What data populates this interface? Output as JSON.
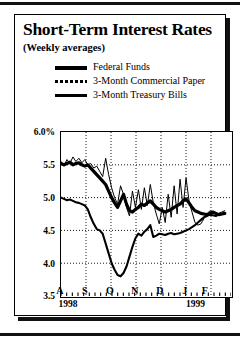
{
  "figure": {
    "title": "Short-Term Interest Rates",
    "subtitle": "(Weekly averages)"
  },
  "chart_data": {
    "type": "line",
    "title": "Short-Term Interest Rates",
    "subtitle": "(Weekly averages)",
    "xlabel": "",
    "ylabel": "",
    "ylim": [
      3.5,
      6.0
    ],
    "yticks": [
      "6.0%",
      "5.5",
      "5.0",
      "4.5",
      "4.0",
      "3.5"
    ],
    "ytick_values": [
      6.0,
      5.5,
      5.0,
      4.5,
      4.0,
      3.5
    ],
    "xticks": [
      "A",
      "S",
      "O",
      "N",
      "D",
      "J",
      "F"
    ],
    "xtick_positions": [
      0.5,
      1.5,
      2.5,
      3.5,
      4.5,
      5.5,
      6.3
    ],
    "year_labels": [
      {
        "text": "1998",
        "x": 0.45
      },
      {
        "text": "1999",
        "x": 5.55
      }
    ],
    "grid": "dotted-both",
    "legend_position": "above-plot",
    "xlim": [
      0,
      6.8
    ],
    "series": [
      {
        "name": "Federal Funds",
        "style": "thick-solid",
        "values": [
          5.52,
          5.5,
          5.52,
          5.54,
          5.5,
          5.52,
          5.53,
          5.5,
          5.48,
          5.5,
          5.45,
          5.4,
          5.35,
          5.3,
          5.25,
          5.2,
          5.1,
          5.0,
          4.92,
          4.85,
          4.95,
          5.05,
          4.9,
          4.8,
          4.78,
          4.82,
          4.85,
          4.9,
          4.88,
          4.92,
          4.95,
          4.9,
          4.85,
          4.82,
          4.8,
          4.78,
          4.8,
          4.82,
          4.85,
          4.88,
          4.9,
          4.95,
          4.98,
          4.92,
          4.85,
          4.8,
          4.78,
          4.76,
          4.75,
          4.74,
          4.76,
          4.78,
          4.76,
          4.74,
          4.75,
          4.76
        ]
      },
      {
        "name": "3-Month Commercial Paper",
        "style": "thin-solid",
        "values": [
          5.55,
          5.48,
          5.58,
          5.52,
          5.62,
          5.55,
          5.6,
          5.53,
          5.58,
          5.5,
          5.52,
          5.45,
          5.48,
          5.4,
          5.32,
          5.6,
          5.35,
          5.15,
          5.0,
          4.9,
          5.18,
          5.05,
          4.85,
          4.72,
          5.1,
          4.85,
          5.12,
          4.82,
          5.15,
          4.88,
          5.2,
          4.92,
          4.75,
          4.6,
          4.85,
          4.62,
          5.05,
          4.7,
          5.18,
          4.75,
          5.28,
          4.85,
          5.3,
          4.95,
          4.78,
          4.62,
          4.58,
          4.6,
          4.68,
          4.75,
          4.8,
          4.78,
          4.74,
          4.76,
          4.78,
          4.8
        ]
      },
      {
        "name": "3-Month Treasury Bills",
        "style": "medium-solid",
        "values": [
          5.0,
          4.98,
          4.96,
          4.97,
          4.95,
          4.93,
          4.92,
          4.9,
          4.88,
          4.82,
          4.7,
          4.6,
          4.52,
          4.5,
          4.45,
          4.3,
          4.15,
          4.0,
          3.9,
          3.82,
          3.8,
          3.85,
          3.95,
          4.1,
          4.25,
          4.38,
          4.45,
          4.42,
          4.48,
          4.52,
          4.58,
          4.4,
          4.42,
          4.45,
          4.44,
          4.43,
          4.45,
          4.46,
          4.44,
          4.45,
          4.46,
          4.48,
          4.5,
          4.52,
          4.55,
          4.58,
          4.62,
          4.66,
          4.7,
          4.72,
          4.74,
          4.73,
          4.72,
          4.74,
          4.75,
          4.76
        ]
      }
    ]
  },
  "legend": [
    {
      "label": "Federal Funds",
      "style": "thick-solid"
    },
    {
      "label": "3-Month Commercial Paper",
      "style": "thin-dashed"
    },
    {
      "label": "3-Month Treasury Bills",
      "style": "medium-solid"
    }
  ]
}
